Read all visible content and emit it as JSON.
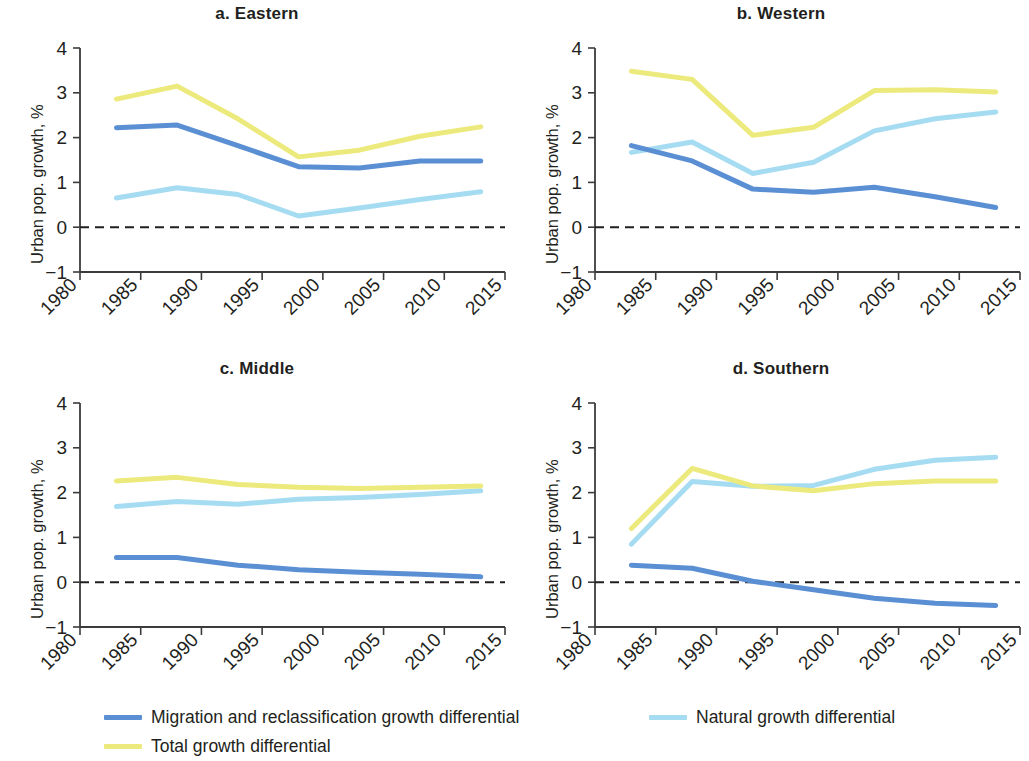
{
  "figure": {
    "y_axis_label": "Urban pop. growth, %",
    "x_tick_labels": [
      "1980",
      "1985",
      "1990",
      "1995",
      "2000",
      "2005",
      "2010",
      "2015"
    ],
    "y_tick_labels": [
      "4",
      "3",
      "2",
      "1",
      "0",
      "−1"
    ]
  },
  "panels": [
    {
      "title": "a. Eastern"
    },
    {
      "title": "b. Western"
    },
    {
      "title": "c. Middle"
    },
    {
      "title": "d. Southern"
    }
  ],
  "legend": {
    "items": [
      {
        "label": "Migration and reclassification growth differential",
        "color": "#5b8fd4"
      },
      {
        "label": "Natural growth differential",
        "color": "#a6dcf2"
      },
      {
        "label": "Total growth differential",
        "color": "#ecea7c"
      }
    ]
  },
  "colors": {
    "migration": "#5b8fd4",
    "natural": "#a6dcf2",
    "total": "#ecea7c",
    "axis": "#3b3b3b",
    "zero_line": "#231f20",
    "text": "#231f20"
  },
  "chart_data": [
    {
      "type": "line",
      "title": "a. Eastern",
      "xlabel": "",
      "ylabel": "Urban pop. growth, %",
      "x": [
        1983,
        1988,
        1993,
        1998,
        2003,
        2008,
        2013
      ],
      "xlim": [
        1980,
        2015
      ],
      "ylim": [
        -1,
        4
      ],
      "xticks": [
        1980,
        1985,
        1990,
        1995,
        2000,
        2005,
        2010,
        2015
      ],
      "yticks": [
        -1,
        0,
        1,
        2,
        3,
        4
      ],
      "grid": false,
      "zero_reference_line": 0,
      "series": [
        {
          "name": "Migration and reclassification growth differential",
          "color": "#5b8fd4",
          "values": [
            2.22,
            2.28,
            1.82,
            1.35,
            1.32,
            1.48,
            1.48
          ]
        },
        {
          "name": "Natural growth differential",
          "color": "#a6dcf2",
          "values": [
            0.65,
            0.88,
            0.73,
            0.25,
            0.43,
            0.62,
            0.79
          ]
        },
        {
          "name": "Total growth differential",
          "color": "#ecea7c",
          "values": [
            2.86,
            3.15,
            2.42,
            1.57,
            1.72,
            2.03,
            2.24
          ]
        }
      ]
    },
    {
      "type": "line",
      "title": "b. Western",
      "xlabel": "",
      "ylabel": "Urban pop. growth, %",
      "x": [
        1983,
        1988,
        1993,
        1998,
        2003,
        2008,
        2013
      ],
      "xlim": [
        1980,
        2015
      ],
      "ylim": [
        -1,
        4
      ],
      "xticks": [
        1980,
        1985,
        1990,
        1995,
        2000,
        2005,
        2010,
        2015
      ],
      "yticks": [
        -1,
        0,
        1,
        2,
        3,
        4
      ],
      "grid": false,
      "zero_reference_line": 0,
      "series": [
        {
          "name": "Migration and reclassification growth differential",
          "color": "#5b8fd4",
          "values": [
            1.82,
            1.48,
            0.85,
            0.78,
            0.89,
            0.68,
            0.44
          ]
        },
        {
          "name": "Natural growth differential",
          "color": "#a6dcf2",
          "values": [
            1.67,
            1.9,
            1.2,
            1.45,
            2.15,
            2.42,
            2.57
          ]
        },
        {
          "name": "Total growth differential",
          "color": "#ecea7c",
          "values": [
            3.48,
            3.3,
            2.05,
            2.23,
            3.05,
            3.07,
            3.02
          ]
        }
      ]
    },
    {
      "type": "line",
      "title": "c. Middle",
      "xlabel": "",
      "ylabel": "Urban pop. growth, %",
      "x": [
        1983,
        1988,
        1993,
        1998,
        2003,
        2008,
        2013
      ],
      "xlim": [
        1980,
        2015
      ],
      "ylim": [
        -1,
        4
      ],
      "xticks": [
        1980,
        1985,
        1990,
        1995,
        2000,
        2005,
        2010,
        2015
      ],
      "yticks": [
        -1,
        0,
        1,
        2,
        3,
        4
      ],
      "grid": false,
      "zero_reference_line": 0,
      "series": [
        {
          "name": "Migration and reclassification growth differential",
          "color": "#5b8fd4",
          "values": [
            0.55,
            0.55,
            0.38,
            0.28,
            0.22,
            0.18,
            0.12
          ]
        },
        {
          "name": "Natural growth differential",
          "color": "#a6dcf2",
          "values": [
            1.69,
            1.8,
            1.74,
            1.85,
            1.89,
            1.96,
            2.04
          ]
        },
        {
          "name": "Total growth differential",
          "color": "#ecea7c",
          "values": [
            2.26,
            2.34,
            2.18,
            2.12,
            2.09,
            2.12,
            2.15
          ]
        }
      ]
    },
    {
      "type": "line",
      "title": "d. Southern",
      "xlabel": "",
      "ylabel": "Urban pop. growth, %",
      "x": [
        1983,
        1988,
        1993,
        1998,
        2003,
        2008,
        2013
      ],
      "xlim": [
        1980,
        2015
      ],
      "ylim": [
        -1,
        4
      ],
      "xticks": [
        1980,
        1985,
        1990,
        1995,
        2000,
        2005,
        2010,
        2015
      ],
      "yticks": [
        -1,
        0,
        1,
        2,
        3,
        4
      ],
      "grid": false,
      "zero_reference_line": 0,
      "series": [
        {
          "name": "Migration and reclassification growth differential",
          "color": "#5b8fd4",
          "values": [
            0.38,
            0.31,
            0.02,
            -0.17,
            -0.36,
            -0.47,
            -0.52
          ]
        },
        {
          "name": "Natural growth differential",
          "color": "#a6dcf2",
          "values": [
            0.85,
            2.25,
            2.14,
            2.16,
            2.52,
            2.72,
            2.79
          ]
        },
        {
          "name": "Total growth differential",
          "color": "#ecea7c",
          "values": [
            1.2,
            2.54,
            2.15,
            2.04,
            2.2,
            2.26,
            2.26
          ]
        }
      ]
    }
  ]
}
